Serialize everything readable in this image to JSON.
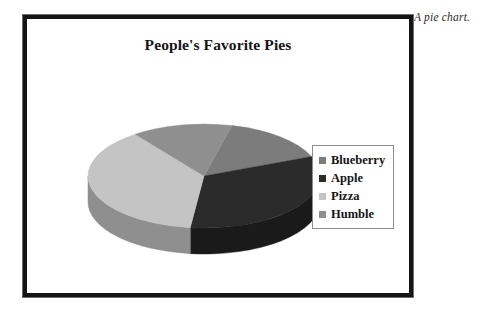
{
  "caption": "A pie chart.",
  "chart": {
    "title": "People's Favorite Pies",
    "legend": {
      "position": "right",
      "entries": [
        {
          "label": "Blueberry",
          "swatch_color": "#7c7c7c"
        },
        {
          "label": "Apple",
          "swatch_color": "#2b2b2b"
        },
        {
          "label": "Pizza",
          "swatch_color": "#c4c4c4"
        },
        {
          "label": "Humble",
          "swatch_color": "#8f8f8f"
        }
      ]
    }
  },
  "chart_data": {
    "type": "pie",
    "title": "People's Favorite Pies",
    "xlabel": "",
    "ylabel": "",
    "three_d": true,
    "legend_position": "right",
    "grid": false,
    "categories": [
      "Blueberry",
      "Apple",
      "Pizza",
      "Humble"
    ],
    "values": [
      15,
      33,
      38,
      14
    ],
    "unit": "percent",
    "colors": [
      "#7c7c7c",
      "#2b2b2b",
      "#c4c4c4",
      "#8f8f8f"
    ],
    "side_colors": [
      "#5e5e5e",
      "#1a1a1a",
      "#8f8f8f",
      "#6d6d6d"
    ],
    "slices": [
      {
        "label": "Blueberry",
        "value": 15,
        "color": "#7c7c7c"
      },
      {
        "label": "Apple",
        "value": 33,
        "color": "#2b2b2b"
      },
      {
        "label": "Pizza",
        "value": 38,
        "color": "#c4c4c4"
      },
      {
        "label": "Humble",
        "value": 14,
        "color": "#8f8f8f"
      }
    ]
  }
}
